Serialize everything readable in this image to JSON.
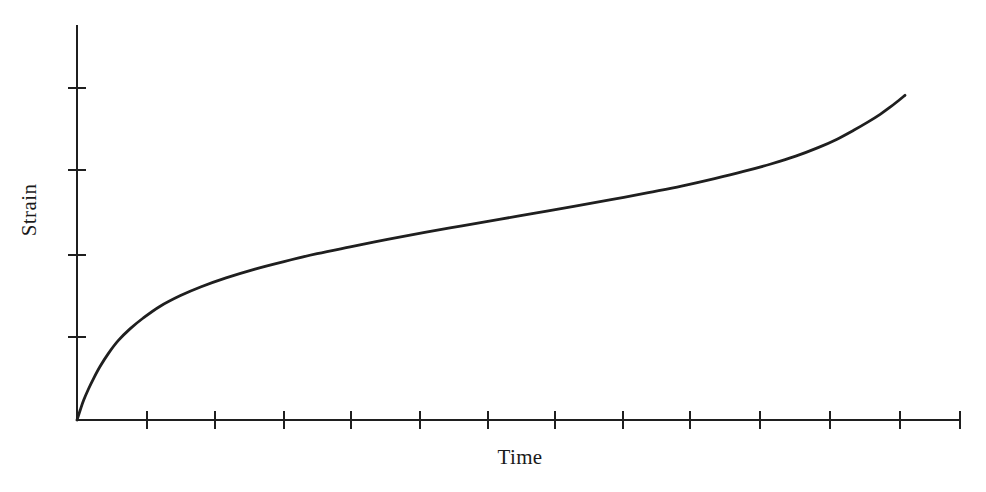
{
  "figure": {
    "background_color": "#ffffff",
    "ink_color": "#1f1f1f",
    "width": 986,
    "height": 492
  },
  "axes": {
    "x_label": "Time",
    "y_label": "Strain",
    "x_label_position": {
      "x": 520,
      "y": 464
    },
    "y_label_position": {
      "x": 36,
      "y": 210
    },
    "origin": {
      "x": 77,
      "y": 420
    },
    "x_axis_end": {
      "x": 960,
      "y": 420
    },
    "y_axis_top": {
      "x": 77,
      "y": 25
    },
    "x_tick_positions": [
      147,
      215,
      284,
      351,
      420,
      488,
      555,
      623,
      690,
      760,
      830,
      900,
      960
    ],
    "y_tick_positions": [
      337,
      255,
      170,
      88
    ],
    "tick_half_length": 9,
    "axis_stroke_width": 2.6,
    "curve_stroke_width": 2.8,
    "ticks_labeled": false,
    "grid": false
  },
  "chart_data": {
    "type": "line",
    "title": "",
    "subtitle": "",
    "xlabel": "Time",
    "ylabel": "Strain",
    "xlim": [
      0,
      1
    ],
    "ylim": [
      0,
      1
    ],
    "grid": false,
    "legend": null,
    "tick_labels_shown": false,
    "series": [
      {
        "name": "Creep strain",
        "color": "#1f1f1f",
        "x": [
          0.0,
          0.004,
          0.008,
          0.014,
          0.02,
          0.028,
          0.038,
          0.05,
          0.064,
          0.08,
          0.1,
          0.125,
          0.15,
          0.18,
          0.215,
          0.25,
          0.29,
          0.33,
          0.375,
          0.42,
          0.465,
          0.51,
          0.555,
          0.6,
          0.645,
          0.69,
          0.73,
          0.77,
          0.805,
          0.838,
          0.868,
          0.895,
          0.918,
          0.938,
          0.955,
          0.97,
          0.982,
          0.992,
          1.0
        ],
        "y": [
          0.0,
          0.03,
          0.058,
          0.092,
          0.122,
          0.158,
          0.196,
          0.234,
          0.268,
          0.3,
          0.334,
          0.366,
          0.392,
          0.418,
          0.444,
          0.466,
          0.489,
          0.509,
          0.531,
          0.552,
          0.571,
          0.59,
          0.609,
          0.628,
          0.648,
          0.669,
          0.688,
          0.71,
          0.731,
          0.753,
          0.776,
          0.801,
          0.826,
          0.852,
          0.876,
          0.899,
          0.92,
          0.939,
          0.955
        ]
      }
    ],
    "stages": [
      {
        "name": "Primary creep",
        "x_start": 0.0,
        "x_end": 0.12
      },
      {
        "name": "Secondary creep",
        "x_start": 0.12,
        "x_end": 0.72
      },
      {
        "name": "Tertiary creep",
        "x_start": 0.72,
        "x_end": 1.0
      }
    ]
  }
}
